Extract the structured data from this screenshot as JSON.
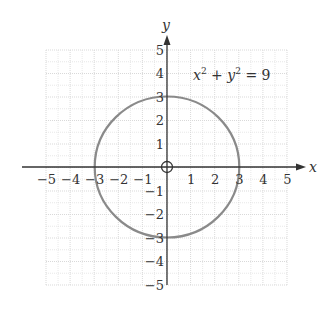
{
  "chart_data": {
    "type": "line",
    "title": "",
    "xlabel": "x",
    "ylabel": "y",
    "xlim": [
      -5,
      5
    ],
    "ylim": [
      -5,
      5
    ],
    "grid": true,
    "x_ticks": [
      "−5",
      "−4",
      "−3",
      "−2",
      "−1",
      "1",
      "2",
      "3",
      "4",
      "5"
    ],
    "y_ticks": [
      "5",
      "4",
      "3",
      "2",
      "1",
      "−1",
      "−2",
      "−3",
      "−4",
      "−5"
    ],
    "annotations": [
      {
        "text": "x² + y² = 9",
        "position": [
          3,
          4
        ]
      }
    ],
    "series": [
      {
        "name": "x² + y² = 9",
        "shape": "circle",
        "center": [
          0,
          0
        ],
        "radius": 3,
        "intercepts": [
          [
            3,
            0
          ],
          [
            -3,
            0
          ],
          [
            0,
            3
          ],
          [
            0,
            -3
          ]
        ],
        "color": "#8a8a8a"
      }
    ],
    "origin_marker": "open-circle-with-cross"
  },
  "labels": {
    "x_axis": "x",
    "y_axis": "y",
    "eq_x": "x",
    "eq_plus": " + ",
    "eq_y": "y",
    "eq_sup": "2",
    "eq_rhs": " = 9"
  },
  "colors": {
    "axis": "#333333",
    "grid": "#d9d9d9",
    "curve": "#8a8a8a"
  }
}
